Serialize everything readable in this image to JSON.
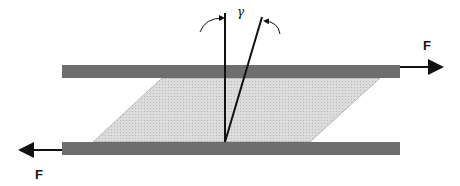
{
  "diagram": {
    "labels": {
      "force_top": "F",
      "force_bottom": "F",
      "shear_angle": "γ"
    },
    "colors": {
      "plate": "#6e6e6e",
      "fluid": "#d4d4d4",
      "line": "#111111"
    }
  }
}
